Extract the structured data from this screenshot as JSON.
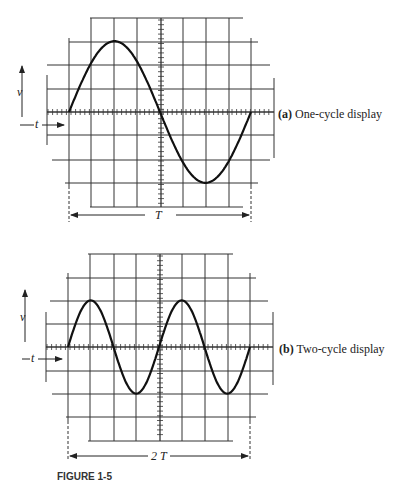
{
  "figure": {
    "panels": [
      {
        "id": "a",
        "label_letter": "(a)",
        "label_text": "One-cycle display",
        "v_label": "v",
        "t_label": "t",
        "span_label": "T",
        "cycles": 1,
        "amplitude_divisions": 3
      },
      {
        "id": "b",
        "label_letter": "(b)",
        "label_text": "Two-cycle display",
        "v_label": "v",
        "t_label": "t",
        "span_label": "2 T",
        "cycles": 2,
        "amplitude_divisions": 2
      }
    ],
    "caption": "FIGURE 1-5"
  },
  "colors": {
    "ink": "#1a1a1a",
    "grid": "#333333",
    "background": "#ffffff"
  }
}
